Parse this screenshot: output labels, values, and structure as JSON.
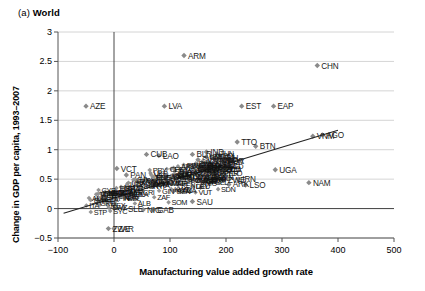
{
  "figure": {
    "panel_index": "(a)",
    "panel_title": "World"
  },
  "chart_data": {
    "type": "scatter",
    "title": "(a) World",
    "xlabel": "Manufacturing value added growth rate",
    "ylabel": "Change in GDP per capita, 1993–2007",
    "xlim": [
      -100,
      500
    ],
    "ylim": [
      -0.5,
      3
    ],
    "xticks": [
      -100,
      0,
      100,
      200,
      300,
      400,
      500
    ],
    "yticks": [
      -0.5,
      0,
      0.5,
      1,
      1.5,
      2,
      2.5,
      3
    ],
    "xtick_labels": [
      "−100",
      "0",
      "100",
      "200",
      "300",
      "400",
      "500"
    ],
    "ytick_labels": [
      "−0.5",
      "0",
      "0.5",
      "1",
      "1.5",
      "2",
      "2.5",
      "3"
    ],
    "grid": "horizontal",
    "legend": "none",
    "marker": "diamond",
    "marker_color": "#8a8a8a",
    "trendline": {
      "present": true,
      "color": "#222222",
      "x_start": -90,
      "y_start": -0.08,
      "x_end": 400,
      "y_end": 1.33
    },
    "vertical_reference_line": {
      "x": 0,
      "color": "#333333"
    },
    "horizontal_reference_line": {
      "y": 0,
      "color": "#333333"
    },
    "labeled_points": [
      {
        "code": "ARM",
        "x": 125,
        "y": 2.6
      },
      {
        "code": "CHN",
        "x": 363,
        "y": 2.43
      },
      {
        "code": "AZE",
        "x": -50,
        "y": 1.74
      },
      {
        "code": "LVA",
        "x": 90,
        "y": 1.74
      },
      {
        "code": "EST",
        "x": 228,
        "y": 1.74
      },
      {
        "code": "EAP",
        "x": 285,
        "y": 1.74
      },
      {
        "code": "TTO",
        "x": 220,
        "y": 1.13
      },
      {
        "code": "BTN",
        "x": 253,
        "y": 1.06
      },
      {
        "code": "VNM",
        "x": 355,
        "y": 1.23
      },
      {
        "code": "AGO",
        "x": 372,
        "y": 1.25
      },
      {
        "code": "CUB",
        "x": 58,
        "y": 0.92
      },
      {
        "code": "LAO",
        "x": 80,
        "y": 0.9
      },
      {
        "code": "BLR",
        "x": 140,
        "y": 0.92
      },
      {
        "code": "IND",
        "x": 165,
        "y": 0.96
      },
      {
        "code": "SVN",
        "x": 150,
        "y": 0.83
      },
      {
        "code": "SAU",
        "x": 178,
        "y": 0.85
      },
      {
        "code": "KOR",
        "x": 195,
        "y": 0.8
      },
      {
        "code": "VCT",
        "x": 5,
        "y": 0.68
      },
      {
        "code": "PAN",
        "x": 22,
        "y": 0.57
      },
      {
        "code": "UGA",
        "x": 288,
        "y": 0.66
      },
      {
        "code": "NAM",
        "x": 348,
        "y": 0.44
      },
      {
        "code": "LSO",
        "x": 235,
        "y": 0.4
      },
      {
        "code": "IRN",
        "x": 222,
        "y": 0.5
      },
      {
        "code": "ZWE",
        "x": 196,
        "y": 0.49
      },
      {
        "code": "ARK",
        "x": 205,
        "y": 0.41
      },
      {
        "code": "SAU",
        "x": 140,
        "y": 0.12
      },
      {
        "code": "SLE",
        "x": 18,
        "y": 0.0
      },
      {
        "code": "ZWE",
        "x": -10,
        "y": -0.34
      },
      {
        "code": "ZAR",
        "x": 0,
        "y": -0.34
      },
      {
        "code": "NIG",
        "x": 52,
        "y": -0.02
      },
      {
        "code": "GAB",
        "x": 70,
        "y": -0.02
      }
    ],
    "dense_cluster": {
      "description": "Large overlapping cluster of country codes centered between x≈20–200 and y≈0.0–0.8",
      "approx_count": 170,
      "x_range": [
        -60,
        210
      ],
      "y_range": [
        -0.35,
        0.95
      ]
    }
  }
}
